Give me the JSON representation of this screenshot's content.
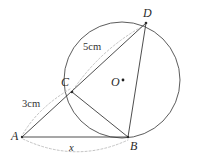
{
  "figure": {
    "type": "circle-geometry-diagram",
    "canvas": {
      "width": 197,
      "height": 161
    },
    "circle": {
      "name": "main-circle",
      "center_label": "O",
      "center": {
        "x": 122,
        "y": 80
      },
      "radius": 58,
      "stroke_color": "#4a4a4a"
    },
    "points": [
      {
        "id": "A",
        "label": "A",
        "x": 22,
        "y": 137,
        "on_circle": false
      },
      {
        "id": "B",
        "label": "B",
        "x": 128,
        "y": 137,
        "on_circle": true
      },
      {
        "id": "C",
        "label": "C",
        "x": 72,
        "y": 92,
        "on_circle": true
      },
      {
        "id": "D",
        "label": "D",
        "x": 146,
        "y": 23,
        "on_circle": true
      },
      {
        "id": "O",
        "label": "O",
        "x": 122,
        "y": 80,
        "on_circle": false
      }
    ],
    "segments": [
      {
        "name": "segment-AB",
        "from": "A",
        "to": "B",
        "style": "solid"
      },
      {
        "name": "segment-AD",
        "from": "A",
        "to": "D",
        "style": "solid",
        "note": "secant through C"
      },
      {
        "name": "segment-CB",
        "from": "C",
        "to": "B",
        "style": "solid"
      },
      {
        "name": "segment-DB",
        "from": "D",
        "to": "B",
        "style": "solid"
      }
    ],
    "measurements": [
      {
        "name": "measure-AC",
        "label": "3cm",
        "from": "A",
        "to": "C",
        "style": "dashed-arc",
        "color": "#b4b4b4"
      },
      {
        "name": "measure-CD",
        "label": "5cm",
        "from": "C",
        "to": "D",
        "style": "dashed-arc",
        "color": "#b4b4b4"
      },
      {
        "name": "measure-AB",
        "label": "x",
        "from": "A",
        "to": "B",
        "style": "dashed-arc",
        "color": "#b4b4b4"
      }
    ],
    "labels": {
      "point_a": "A",
      "point_b": "B",
      "point_c": "C",
      "point_d": "D",
      "center_o": "O",
      "length_ac": "3cm",
      "length_cd": "5cm",
      "length_ab": "x"
    }
  }
}
